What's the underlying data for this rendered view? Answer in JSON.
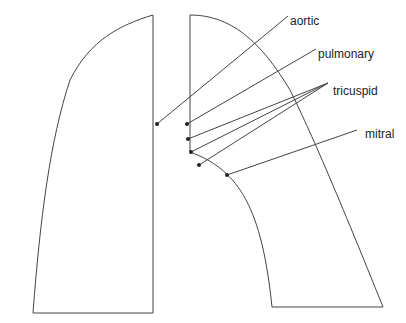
{
  "diagram": {
    "title": "",
    "labels": {
      "aortic": "aortic",
      "pulmonary": "pulmonary",
      "tricuspid": "tricuspid",
      "mitral": "mitral"
    },
    "stroke_color": "#333333"
  }
}
